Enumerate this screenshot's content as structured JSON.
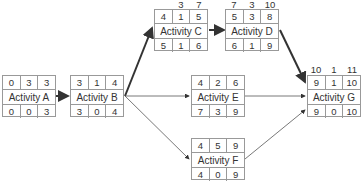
{
  "diagram": {
    "type": "activity-on-node network (critical path)",
    "nodes": [
      {
        "id": "A",
        "label": "Activity A",
        "top": [
          "0",
          "3",
          "3"
        ],
        "bottom": [
          "0",
          "0",
          "3"
        ],
        "above": null
      },
      {
        "id": "B",
        "label": "Activity B",
        "top": [
          "3",
          "1",
          "4"
        ],
        "bottom": [
          "3",
          "0",
          "4"
        ],
        "above": null
      },
      {
        "id": "C",
        "label": "Activity C",
        "top": [
          "4",
          "1",
          "5"
        ],
        "bottom": [
          "5",
          "1",
          "6"
        ],
        "above": [
          "",
          "3",
          "7"
        ]
      },
      {
        "id": "D",
        "label": "Activity D",
        "top": [
          "5",
          "3",
          "8"
        ],
        "bottom": [
          "6",
          "1",
          "9"
        ],
        "above": [
          "7",
          "3",
          "10"
        ]
      },
      {
        "id": "E",
        "label": "Activity E",
        "top": [
          "4",
          "2",
          "6"
        ],
        "bottom": [
          "7",
          "3",
          "9"
        ],
        "above": null
      },
      {
        "id": "F",
        "label": "Activity F",
        "top": [
          "4",
          "5",
          "9"
        ],
        "bottom": [
          "4",
          "0",
          "9"
        ],
        "above": null
      },
      {
        "id": "G",
        "label": "Activity G",
        "top": [
          "9",
          "1",
          "10"
        ],
        "bottom": [
          "9",
          "0",
          "10"
        ],
        "above": [
          "10",
          "1",
          "11"
        ]
      }
    ],
    "edges": [
      {
        "from": "A",
        "to": "B",
        "weight": "bold"
      },
      {
        "from": "B",
        "to": "C",
        "weight": "bold"
      },
      {
        "from": "B",
        "to": "E",
        "weight": "thin"
      },
      {
        "from": "B",
        "to": "F",
        "weight": "thin"
      },
      {
        "from": "C",
        "to": "D",
        "weight": "bold"
      },
      {
        "from": "D",
        "to": "G",
        "weight": "bold"
      },
      {
        "from": "E",
        "to": "G",
        "weight": "thin"
      },
      {
        "from": "F",
        "to": "G",
        "weight": "thin"
      }
    ],
    "colors": {
      "line": "#333333",
      "border": "#999999",
      "text": "#333333"
    }
  }
}
